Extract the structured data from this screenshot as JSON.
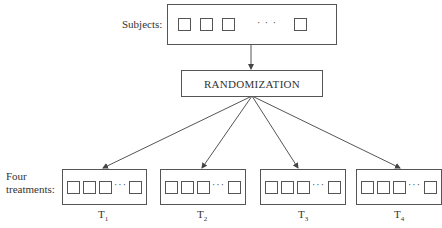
{
  "subjects": {
    "label": "Subjects:",
    "ellipsis": "· · ·"
  },
  "randomization": {
    "label": "RANDOMIZATION"
  },
  "treatments": {
    "label_line1": "Four",
    "label_line2": "treatments:",
    "ellipsis": "···",
    "groups": [
      {
        "letter": "T",
        "sub": "1"
      },
      {
        "letter": "T",
        "sub": "2"
      },
      {
        "letter": "T",
        "sub": "3"
      },
      {
        "letter": "T",
        "sub": "4"
      }
    ]
  },
  "colors": {
    "stroke": "#555555",
    "text": "#333333",
    "background": "#ffffff"
  }
}
